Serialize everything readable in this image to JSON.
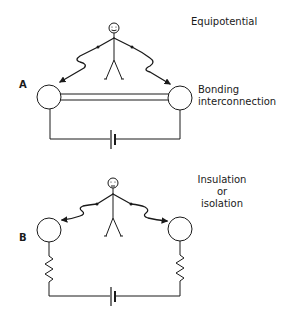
{
  "panels": [
    {
      "letter": "A",
      "title": "Equipotential",
      "connection_label_line1": "Bonding",
      "connection_label_line2": "interconnection",
      "components": [
        "person",
        "left-conductor",
        "right-conductor",
        "bonding-interconnection",
        "battery"
      ]
    },
    {
      "letter": "B",
      "title_line1": "Insulation",
      "title_line2": "or",
      "title_line3": "isolation",
      "components": [
        "person",
        "left-conductor",
        "right-conductor",
        "left-resistor",
        "right-resistor",
        "battery"
      ]
    }
  ],
  "colors": {
    "stroke": "#1a1a1a",
    "background": "#ffffff"
  }
}
